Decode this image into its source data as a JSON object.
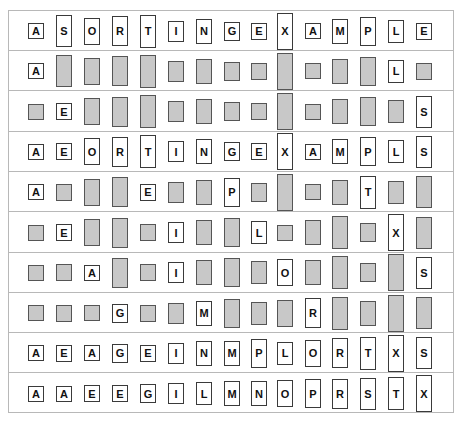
{
  "figure": {
    "title": "",
    "colors": {
      "shown_fill": "#ffffff",
      "hidden_fill": "#c8c8c8",
      "border": "#3a3a3a",
      "rule": "#b8b8b8"
    },
    "rows": [
      {
        "keys": [
          "A",
          "S",
          "O",
          "R",
          "T",
          "I",
          "N",
          "G",
          "E",
          "X",
          "A",
          "M",
          "P",
          "L",
          "E"
        ],
        "shown": [
          1,
          1,
          1,
          1,
          1,
          1,
          1,
          1,
          1,
          1,
          1,
          1,
          1,
          1,
          1
        ]
      },
      {
        "keys": [
          "A",
          "S",
          "O",
          "R",
          "T",
          "I",
          "N",
          "G",
          "E",
          "X",
          "A",
          "M",
          "P",
          "L",
          "E"
        ],
        "shown": [
          1,
          0,
          0,
          0,
          0,
          0,
          0,
          0,
          0,
          0,
          0,
          0,
          0,
          1,
          0
        ]
      },
      {
        "keys": [
          "A",
          "E",
          "O",
          "R",
          "T",
          "I",
          "N",
          "G",
          "E",
          "X",
          "A",
          "M",
          "P",
          "L",
          "S"
        ],
        "shown": [
          0,
          1,
          0,
          0,
          0,
          0,
          0,
          0,
          0,
          0,
          0,
          0,
          0,
          0,
          1
        ]
      },
      {
        "keys": [
          "A",
          "E",
          "O",
          "R",
          "T",
          "I",
          "N",
          "G",
          "E",
          "X",
          "A",
          "M",
          "P",
          "L",
          "S"
        ],
        "shown": [
          1,
          1,
          1,
          1,
          1,
          1,
          1,
          1,
          1,
          1,
          1,
          1,
          1,
          1,
          1
        ]
      },
      {
        "keys": [
          "A",
          "E",
          "O",
          "R",
          "E",
          "I",
          "N",
          "P",
          "G",
          "X",
          "A",
          "M",
          "T",
          "L",
          "S"
        ],
        "shown": [
          1,
          0,
          0,
          0,
          1,
          0,
          0,
          1,
          0,
          0,
          0,
          0,
          1,
          0,
          0
        ]
      },
      {
        "keys": [
          "A",
          "E",
          "O",
          "R",
          "E",
          "I",
          "N",
          "P",
          "L",
          "A",
          "M",
          "T",
          "G",
          "X",
          "S"
        ],
        "shown": [
          0,
          1,
          0,
          0,
          0,
          1,
          0,
          0,
          1,
          0,
          0,
          0,
          0,
          1,
          0
        ]
      },
      {
        "keys": [
          "A",
          "E",
          "A",
          "R",
          "E",
          "I",
          "N",
          "P",
          "L",
          "O",
          "M",
          "T",
          "G",
          "X",
          "S"
        ],
        "shown": [
          0,
          0,
          1,
          0,
          0,
          1,
          0,
          0,
          0,
          1,
          0,
          0,
          0,
          0,
          1
        ]
      },
      {
        "keys": [
          "A",
          "E",
          "A",
          "G",
          "E",
          "I",
          "M",
          "P",
          "L",
          "O",
          "R",
          "T",
          "N",
          "X",
          "S"
        ],
        "shown": [
          0,
          0,
          0,
          1,
          0,
          0,
          1,
          0,
          0,
          0,
          1,
          0,
          0,
          0,
          0
        ]
      },
      {
        "keys": [
          "A",
          "E",
          "A",
          "G",
          "E",
          "I",
          "N",
          "M",
          "P",
          "L",
          "O",
          "R",
          "T",
          "X",
          "S"
        ],
        "shown": [
          1,
          1,
          1,
          1,
          1,
          1,
          1,
          1,
          1,
          1,
          1,
          1,
          1,
          1,
          1
        ]
      },
      {
        "keys": [
          "A",
          "A",
          "E",
          "E",
          "G",
          "I",
          "L",
          "M",
          "N",
          "O",
          "P",
          "R",
          "S",
          "T",
          "X"
        ],
        "shown": [
          1,
          1,
          1,
          1,
          1,
          1,
          1,
          1,
          1,
          1,
          1,
          1,
          1,
          1,
          1
        ]
      }
    ]
  }
}
